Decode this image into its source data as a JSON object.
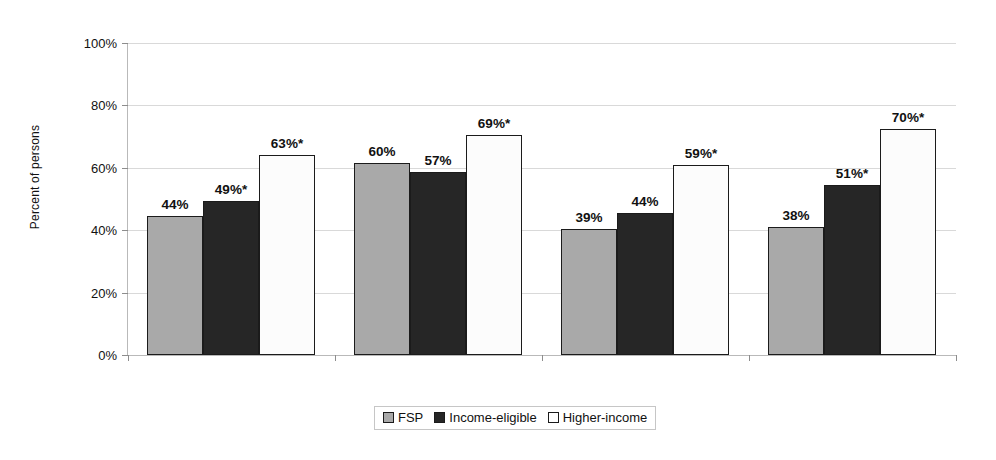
{
  "chart_data": {
    "type": "bar",
    "title": "",
    "xlabel": "",
    "ylabel": "Percent of persons",
    "ylim": [
      0,
      100
    ],
    "ytick_labels": [
      "0%",
      "20%",
      "40%",
      "60%",
      "80%",
      "100%"
    ],
    "ytick_values": [
      0,
      20,
      40,
      60,
      80,
      100
    ],
    "grid": true,
    "legend_position": "bottom-center",
    "categories": [
      "All persons",
      "Children",
      "Adults",
      "Older adults"
    ],
    "series": [
      {
        "name": "FSP",
        "color": "#a9a9a9",
        "values": [
          44,
          60,
          39,
          38
        ],
        "labels": [
          "44%",
          "60%",
          "39%",
          "38%"
        ],
        "plotted": [
          44.5,
          61.5,
          40.5,
          41.0
        ]
      },
      {
        "name": "Income-eligible",
        "color": "#262626",
        "values": [
          49,
          57,
          44,
          51
        ],
        "labels": [
          "49%*",
          "57%",
          "44%",
          "51%*"
        ],
        "plotted": [
          49.5,
          58.5,
          45.5,
          54.5
        ]
      },
      {
        "name": "Higher-income",
        "color": "#ffffff",
        "values": [
          63,
          69,
          59,
          70
        ],
        "labels": [
          "63%*",
          "69%*",
          "59%*",
          "70%*"
        ],
        "plotted": [
          64.0,
          70.5,
          61.0,
          72.5
        ]
      }
    ],
    "annotations": [
      "* denotes statistically significant difference"
    ],
    "colors": {
      "fsp": "#a9a9a9",
      "income_eligible": "#262626",
      "higher_income": "#ffffff",
      "bar_outline": "#1b1b1b",
      "gridline": "#d9d9d9",
      "axis": "#b9b9b9"
    }
  },
  "legend": {
    "items": [
      {
        "label": "FSP",
        "swatch": "series-fsp"
      },
      {
        "label": "Income-eligible",
        "swatch": "series-income"
      },
      {
        "label": "Higher-income",
        "swatch": "series-higher"
      }
    ]
  }
}
